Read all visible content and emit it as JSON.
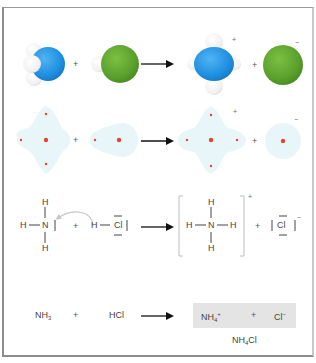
{
  "diagram": {
    "colors": {
      "nitrogen": "#1f8fe0",
      "chlorine": "#5aa02c",
      "hydrogen": "#f4f4f4",
      "density_cloud": "#e8f6fa",
      "nucleus": "#e8442a",
      "frame": "#8c8c8c",
      "product_box": "#e4e4e4"
    },
    "rows": [
      {
        "name": "space-filling-models",
        "reactants": [
          "NH3 (blue N with 3 white H)",
          "HCl (green Cl with white H)"
        ],
        "plus": "+",
        "products": [
          "NH4+ (blue N with 4 white H)",
          "Cl- (green sphere)"
        ],
        "product_plus": "+",
        "charges": [
          "+",
          "−"
        ]
      },
      {
        "name": "electron-density-clouds",
        "plus": "+",
        "product_plus": "+",
        "charges": [
          "+",
          "−"
        ]
      },
      {
        "name": "lewis-structures",
        "ammonia": {
          "h_top": "H",
          "h_left": "H",
          "center": "N",
          "h_bottom": "H"
        },
        "plus": "+",
        "hcl": {
          "h": "H",
          "cl": "Cl"
        },
        "ammonium": {
          "h_top": "H",
          "h_left": "H",
          "center": "N",
          "h_right": "H",
          "h_bottom": "H",
          "charge": "+"
        },
        "product_plus": "+",
        "chloride": {
          "cl": "Cl",
          "charge": "−"
        }
      },
      {
        "name": "formula-equation",
        "reactant1": {
          "base": "NH",
          "sub": "3"
        },
        "plus": "+",
        "reactant2": "HCl",
        "product1": {
          "base": "NH",
          "sub": "4",
          "sup": "+"
        },
        "product_plus": "+",
        "product2": {
          "base": "Cl",
          "sup": "−"
        },
        "salt_label": {
          "base": "NH",
          "sub": "4",
          "tail": "Cl"
        }
      }
    ]
  }
}
